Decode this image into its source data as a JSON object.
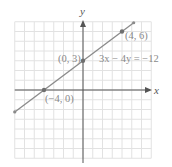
{
  "chart_data": {
    "type": "line",
    "title": "",
    "xlabel": "x",
    "ylabel": "y",
    "xlim": [
      -7,
      7
    ],
    "ylim": [
      -7,
      7
    ],
    "grid": true,
    "series": [
      {
        "name": "3x − 4y = −12",
        "equation": "3x − 4y = −12",
        "x": [
          -7,
          -4,
          0,
          4,
          5.2
        ],
        "y": [
          -2.25,
          0,
          3,
          6,
          6.9
        ]
      }
    ],
    "points": [
      {
        "x": -4,
        "y": 0,
        "label": "(−4, 0)"
      },
      {
        "x": 0,
        "y": 3,
        "label": "(0, 3)"
      },
      {
        "x": 4,
        "y": 6,
        "label": "(4, 6)"
      }
    ],
    "annotations": [
      {
        "text": "3x − 4y = −12",
        "x": 1.6,
        "y": 2.9
      }
    ]
  },
  "labels": {
    "x_axis": "x",
    "y_axis": "y",
    "equation": "3x − 4y = −12",
    "point_a": "(4, 6)",
    "point_b": "(0, 3)",
    "point_c": "(−4, 0)"
  },
  "colors": {
    "grid": "#e2e2e2",
    "axes": "#555555",
    "line": "#8a8a8a",
    "text": "#8a8a8a"
  }
}
